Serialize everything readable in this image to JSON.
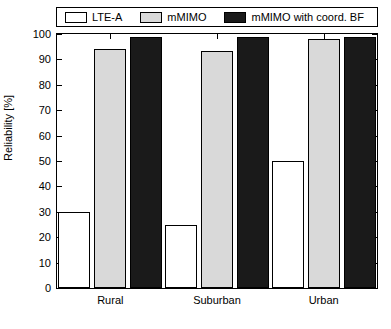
{
  "chart_data": {
    "type": "bar",
    "title": "",
    "xlabel": "",
    "ylabel": "Reliability [%]",
    "categories": [
      "Rural",
      "Suburban",
      "Urban"
    ],
    "series": [
      {
        "name": "LTE-A",
        "color": "#ffffff",
        "values": [
          30,
          25,
          50
        ]
      },
      {
        "name": "mMIMO",
        "color": "#d9d9d9",
        "values": [
          94,
          93.5,
          98
        ]
      },
      {
        "name": "mMIMO with coord. BF",
        "color": "#1a1a1a",
        "values": [
          99,
          99,
          99
        ]
      }
    ],
    "ylim": [
      0,
      100
    ],
    "yticks": [
      0,
      10,
      20,
      30,
      40,
      50,
      60,
      70,
      80,
      90,
      100
    ],
    "ytick_labels": [
      "0",
      "10",
      "20",
      "30",
      "40",
      "50",
      "60",
      "70",
      "80",
      "90",
      "100"
    ],
    "grid": false,
    "legend_position": "top"
  },
  "legend": {
    "entries": [
      {
        "label": "LTE-A"
      },
      {
        "label": "mMIMO"
      },
      {
        "label": "mMIMO with coord. BF"
      }
    ]
  }
}
